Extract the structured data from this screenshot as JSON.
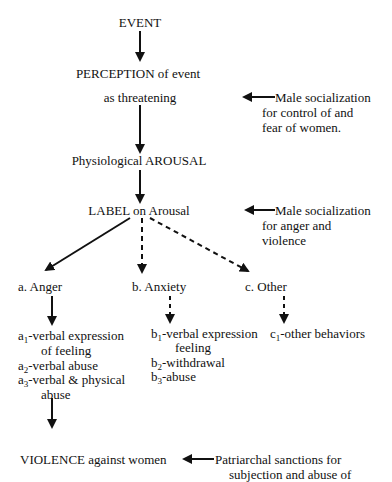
{
  "nodes": {
    "event": "EVENT",
    "perception_line1": "PERCEPTION of event",
    "perception_line2": "as threatening",
    "arousal": "Physiological AROUSAL",
    "label": "LABEL on Arousal",
    "violence": "VIOLENCE against women"
  },
  "side_notes": {
    "note1": [
      "Male socialization",
      "for control of and",
      "fear of women."
    ],
    "note2": [
      "Male socialization",
      "for anger and",
      "violence"
    ],
    "note3": [
      "Patriarchal sanctions for",
      "subjection and abuse of"
    ]
  },
  "branches": {
    "a": {
      "title": "a. Anger",
      "items": [
        {
          "prefix": "a",
          "sub": "1",
          "text": "-verbal expression",
          "cont": "of feeling"
        },
        {
          "prefix": "a",
          "sub": "2",
          "text": "-verbal abuse"
        },
        {
          "prefix": "a",
          "sub": "3",
          "text": "-verbal & physical",
          "cont": "abuse"
        }
      ]
    },
    "b": {
      "title": "b. Anxiety",
      "items": [
        {
          "prefix": "b",
          "sub": "1",
          "text": "-verbal expression",
          "cont": "feeling"
        },
        {
          "prefix": "b",
          "sub": "2",
          "text": "-withdrawal"
        },
        {
          "prefix": "b",
          "sub": "3",
          "text": "-abuse"
        }
      ]
    },
    "c": {
      "title": "c. Other",
      "items": [
        {
          "prefix": "c",
          "sub": "1",
          "text": "-other behaviors"
        }
      ]
    }
  }
}
